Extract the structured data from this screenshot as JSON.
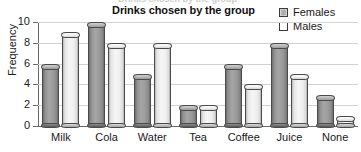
{
  "chart_data": {
    "type": "bar",
    "title": "Drinks chosen by the group",
    "xlabel": "",
    "ylabel": "Frequency",
    "categories": [
      "Milk",
      "Cola",
      "Water",
      "Tea",
      "Coffee",
      "Juice",
      "None"
    ],
    "series": [
      {
        "name": "Females",
        "values": [
          6,
          10,
          5,
          2,
          6,
          8,
          3
        ],
        "color": "#a0a0a0"
      },
      {
        "name": "Males",
        "values": [
          9,
          8,
          8,
          2,
          4,
          5,
          1
        ],
        "color": "#ffffff"
      }
    ],
    "ylim": [
      0,
      10
    ],
    "yticks": [
      0,
      2,
      4,
      6,
      8,
      10
    ],
    "grid": true,
    "legend_position": "top-right"
  },
  "legend": {
    "items": [
      {
        "label": "Females",
        "swatch": "filled-gray-square-icon"
      },
      {
        "label": "Males",
        "swatch": "empty-white-square-icon"
      }
    ]
  },
  "ghost_text": "Drinks chosen by the group"
}
